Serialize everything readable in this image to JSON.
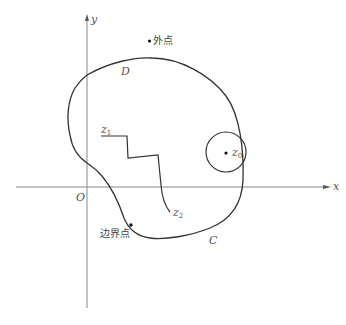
{
  "diagram": {
    "type": "complex-plane-region",
    "axes": {
      "x_label": "x",
      "y_label": "y",
      "origin_label": "O"
    },
    "region": {
      "label": "D",
      "boundary_label": "C"
    },
    "points": {
      "exterior_point_label": "外点",
      "boundary_point_label": "边界点",
      "interior_center_label": "z",
      "interior_center_sub": "0",
      "path_start_label": "z",
      "path_start_sub": "1",
      "path_end_label": "z",
      "path_end_sub": "2"
    },
    "colors": {
      "axis": "#888888",
      "curve": "#333333",
      "text": "#555555"
    }
  }
}
